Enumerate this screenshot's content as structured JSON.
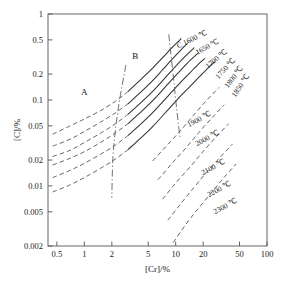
{
  "chart_data": {
    "type": "line",
    "title": "",
    "xlabel": "[Cr]/%",
    "ylabel": "[C]/%",
    "xscale": "log",
    "yscale": "log",
    "xlim": [
      0.4,
      100
    ],
    "ylim": [
      0.002,
      1
    ],
    "grid": false,
    "legend_position": "inline-annotations",
    "xticks": [
      {
        "value": 0.5,
        "label": "0.5"
      },
      {
        "value": 1,
        "label": "1"
      },
      {
        "value": 2,
        "label": "2"
      },
      {
        "value": 5,
        "label": "5"
      },
      {
        "value": 10,
        "label": "10"
      },
      {
        "value": 20,
        "label": "20"
      },
      {
        "value": 50,
        "label": "50"
      },
      {
        "value": 100,
        "label": "100"
      }
    ],
    "yticks": [
      {
        "value": 1,
        "label": "1"
      },
      {
        "value": 0.5,
        "label": "0.5"
      },
      {
        "value": 0.2,
        "label": "0.2"
      },
      {
        "value": 0.1,
        "label": "0.1"
      },
      {
        "value": 0.05,
        "label": "0.05"
      },
      {
        "value": 0.02,
        "label": "0.02"
      },
      {
        "value": 0.01,
        "label": "0.01"
      },
      {
        "value": 0.005,
        "label": "0.005"
      },
      {
        "value": 0.002,
        "label": "0.002"
      }
    ],
    "region_labels": [
      {
        "text": "A",
        "x": 1.0,
        "y": 0.115
      },
      {
        "text": "B",
        "x": 3.6,
        "y": 0.3
      },
      {
        "text": "C",
        "x": 8.4,
        "y": 0.52
      }
    ],
    "series": [
      {
        "name": "1600 °C",
        "label": "1600 ℃",
        "style": "solid-with-dashed-extension",
        "points": [
          [
            0.45,
            0.04
          ],
          [
            0.7,
            0.05
          ],
          [
            1.0,
            0.06
          ],
          [
            1.5,
            0.075
          ],
          [
            2.2,
            0.097
          ],
          [
            3.0,
            0.125
          ],
          [
            4.2,
            0.175
          ],
          [
            5.6,
            0.235
          ],
          [
            7.2,
            0.31
          ],
          [
            9.0,
            0.4
          ],
          [
            10.5,
            0.47
          ],
          [
            11.5,
            0.52
          ]
        ],
        "dashed_until_x": 3.0
      },
      {
        "name": "1650 °C",
        "label": "1650 ℃",
        "style": "solid-with-dashed-extension",
        "points": [
          [
            0.45,
            0.029
          ],
          [
            0.7,
            0.035
          ],
          [
            1.0,
            0.043
          ],
          [
            1.5,
            0.055
          ],
          [
            2.2,
            0.071
          ],
          [
            3.0,
            0.09
          ],
          [
            4.2,
            0.125
          ],
          [
            5.6,
            0.168
          ],
          [
            7.2,
            0.225
          ],
          [
            9.0,
            0.292
          ],
          [
            11.5,
            0.385
          ],
          [
            13.5,
            0.455
          ]
        ],
        "dashed_until_x": 3.0
      },
      {
        "name": "1700 °C",
        "label": "1700 ℃",
        "style": "solid-with-dashed-extension",
        "points": [
          [
            0.45,
            0.022
          ],
          [
            0.7,
            0.026
          ],
          [
            1.0,
            0.032
          ],
          [
            1.5,
            0.041
          ],
          [
            2.2,
            0.053
          ],
          [
            3.0,
            0.068
          ],
          [
            4.2,
            0.094
          ],
          [
            5.6,
            0.126
          ],
          [
            7.2,
            0.168
          ],
          [
            9.0,
            0.218
          ],
          [
            11.5,
            0.288
          ],
          [
            14.0,
            0.355
          ],
          [
            16.0,
            0.405
          ]
        ],
        "dashed_until_x": 3.0
      },
      {
        "name": "1750 °C",
        "label": "1750 ℃",
        "style": "solid-with-dashed-extension",
        "points": [
          [
            0.45,
            0.0175
          ],
          [
            0.7,
            0.021
          ],
          [
            1.0,
            0.025
          ],
          [
            1.5,
            0.032
          ],
          [
            2.2,
            0.0415
          ],
          [
            3.0,
            0.053
          ],
          [
            4.2,
            0.073
          ],
          [
            5.6,
            0.098
          ],
          [
            7.2,
            0.131
          ],
          [
            9.0,
            0.17
          ],
          [
            11.5,
            0.225
          ],
          [
            14.5,
            0.29
          ],
          [
            17.5,
            0.35
          ]
        ],
        "dashed_until_x": 3.0
      },
      {
        "name": "1800 °C",
        "label": "1800 ℃",
        "style": "solid-with-dashed-extension",
        "points": [
          [
            0.45,
            0.0125
          ],
          [
            0.7,
            0.0152
          ],
          [
            1.0,
            0.0183
          ],
          [
            1.5,
            0.0233
          ],
          [
            2.2,
            0.03
          ],
          [
            3.0,
            0.0385
          ],
          [
            4.2,
            0.053
          ],
          [
            5.6,
            0.071
          ],
          [
            7.2,
            0.095
          ],
          [
            9.0,
            0.123
          ],
          [
            11.5,
            0.163
          ],
          [
            14.5,
            0.21
          ],
          [
            18.0,
            0.265
          ],
          [
            21.0,
            0.305
          ]
        ],
        "dashed_until_x": 3.0
      },
      {
        "name": "1850 °C",
        "label": "1850 ℃",
        "style": "solid-with-dashed-extension",
        "points": [
          [
            0.45,
            0.0085
          ],
          [
            0.7,
            0.0103
          ],
          [
            1.0,
            0.0125
          ],
          [
            1.5,
            0.016
          ],
          [
            2.2,
            0.0206
          ],
          [
            3.0,
            0.0264
          ],
          [
            4.2,
            0.0365
          ],
          [
            5.6,
            0.049
          ],
          [
            7.2,
            0.0655
          ],
          [
            9.0,
            0.085
          ],
          [
            11.5,
            0.113
          ],
          [
            14.5,
            0.145
          ],
          [
            18.0,
            0.184
          ],
          [
            23.0,
            0.24
          ],
          [
            27.0,
            0.28
          ]
        ],
        "dashed_until_x": 3.0
      },
      {
        "name": "1900 °C",
        "label": "1900 ℃",
        "style": "dashed",
        "points": [
          [
            5.6,
            0.0195
          ],
          [
            8.0,
            0.0295
          ],
          [
            11.5,
            0.045
          ],
          [
            16.0,
            0.068
          ],
          [
            22.0,
            0.1
          ],
          [
            30.0,
            0.14
          ]
        ]
      },
      {
        "name": "2000 °C",
        "label": "2000 ℃",
        "style": "dashed",
        "points": [
          [
            6.4,
            0.0118
          ],
          [
            9.0,
            0.018
          ],
          [
            13.0,
            0.0278
          ],
          [
            18.0,
            0.042
          ],
          [
            25.0,
            0.062
          ],
          [
            34.0,
            0.088
          ]
        ]
      },
      {
        "name": "2100 °C",
        "label": "2100 ℃",
        "style": "dashed",
        "points": [
          [
            7.2,
            0.007
          ],
          [
            10.0,
            0.0108
          ],
          [
            14.5,
            0.0168
          ],
          [
            20.0,
            0.0252
          ],
          [
            28.0,
            0.0375
          ],
          [
            38.0,
            0.053
          ]
        ]
      },
      {
        "name": "2200 °C",
        "label": "2200 ℃",
        "style": "dashed",
        "points": [
          [
            8.2,
            0.004
          ],
          [
            11.5,
            0.0063
          ],
          [
            16.0,
            0.0097
          ],
          [
            22.0,
            0.0146
          ],
          [
            31.0,
            0.0218
          ],
          [
            42.0,
            0.0308
          ]
        ]
      },
      {
        "name": "2300 °C",
        "label": "2300 ℃",
        "style": "dashed",
        "points": [
          [
            9.4,
            0.0022
          ],
          [
            13.0,
            0.0036
          ],
          [
            18.0,
            0.0056
          ],
          [
            25.0,
            0.0085
          ],
          [
            34.0,
            0.0126
          ],
          [
            46.0,
            0.018
          ]
        ]
      }
    ],
    "boundary_lines": [
      {
        "name": "A-B boundary",
        "style": "dash-dot",
        "points": [
          [
            2.85,
            0.255
          ],
          [
            2.45,
            0.105
          ],
          [
            2.2,
            0.047
          ],
          [
            2.05,
            0.0205
          ],
          [
            2.0,
            0.0073
          ]
        ]
      },
      {
        "name": "B-C boundary",
        "style": "dash-dot",
        "points": [
          [
            8.4,
            0.58
          ],
          [
            9.3,
            0.215
          ],
          [
            10.2,
            0.083
          ],
          [
            11.2,
            0.035
          ]
        ]
      }
    ],
    "curve_labels": [
      {
        "text": "C 1600 ℃",
        "x": 208,
        "y": 34,
        "rot": -26
      },
      {
        "text": "1650 ℃",
        "x": 220,
        "y": 42,
        "rot": -30
      },
      {
        "text": "1700 ℃",
        "x": 228,
        "y": 52,
        "rot": -40
      },
      {
        "text": "1750 ℃",
        "x": 236,
        "y": 60,
        "rot": -48
      },
      {
        "text": "1800 ℃",
        "x": 244,
        "y": 68,
        "rot": -52
      },
      {
        "text": "1850 ℃",
        "x": 250,
        "y": 76,
        "rot": -56
      },
      {
        "text": "1900 ℃",
        "x": 212,
        "y": 115,
        "rot": -28
      },
      {
        "text": "2000 ℃",
        "x": 220,
        "y": 134,
        "rot": -28
      },
      {
        "text": "2100 ℃",
        "x": 226,
        "y": 163,
        "rot": -28
      },
      {
        "text": "2200 ℃",
        "x": 232,
        "y": 185,
        "rot": -28
      },
      {
        "text": "2300 ℃",
        "x": 238,
        "y": 202,
        "rot": -28
      }
    ]
  },
  "axes": {
    "x_title": "[Cr]/%",
    "y_title": "[C]/%"
  }
}
